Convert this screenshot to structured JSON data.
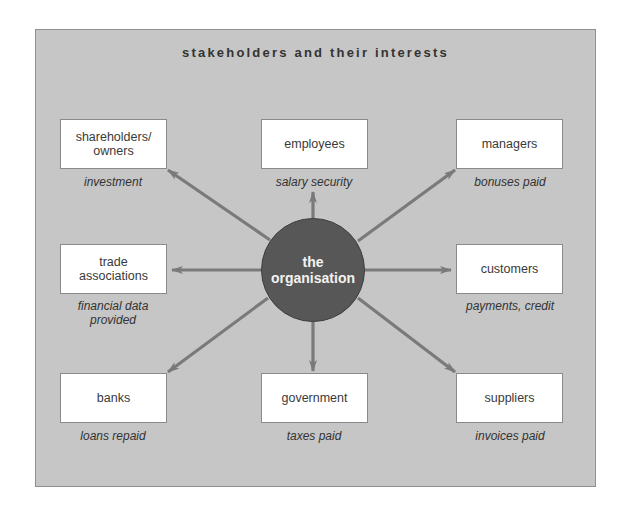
{
  "title": "stakeholders and their interests",
  "hub": {
    "label": "the\norganisation"
  },
  "colors": {
    "panel": "#c6c6c6",
    "hub": "#575757",
    "arrow": "#7a7a7a",
    "box": "#ffffff"
  },
  "stakeholders": [
    {
      "name": "shareholders/\nowners",
      "interest": "investment"
    },
    {
      "name": "employees",
      "interest": "salary security"
    },
    {
      "name": "managers",
      "interest": "bonuses paid"
    },
    {
      "name": "trade\nassociations",
      "interest": "financial data\nprovided"
    },
    {
      "name": "customers",
      "interest": "payments, credit"
    },
    {
      "name": "banks",
      "interest": "loans repaid"
    },
    {
      "name": "government",
      "interest": "taxes paid"
    },
    {
      "name": "suppliers",
      "interest": "invoices paid"
    }
  ]
}
